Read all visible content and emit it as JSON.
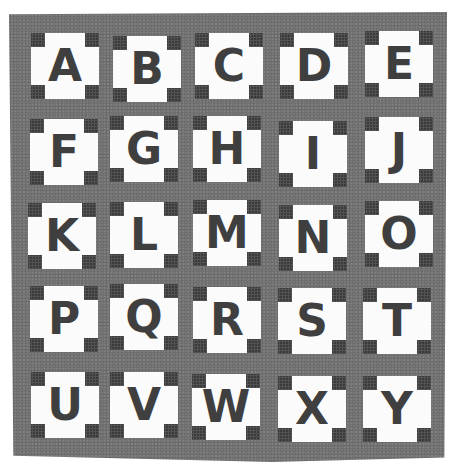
{
  "image": {
    "description": "Black and white photograph of an alphabet quilt: 25 white blocks with dark square corners and dark appliqued letters on a gray background",
    "background_color": "#ffffff",
    "quilt_color": "#777777",
    "block_color": "#fbfbfb",
    "letter_color": "#3f3f3f",
    "corner_color": "#3a3a3a"
  },
  "quilt": {
    "rows": [
      {
        "letters": [
          "A",
          "B",
          "C",
          "D",
          "E"
        ]
      },
      {
        "letters": [
          "F",
          "G",
          "H",
          "I",
          "J"
        ]
      },
      {
        "letters": [
          "K",
          "L",
          "M",
          "N",
          "O"
        ]
      },
      {
        "letters": [
          "P",
          "Q",
          "R",
          "S",
          "T"
        ]
      },
      {
        "letters": [
          "U",
          "V",
          "W",
          "X",
          "Y"
        ]
      }
    ]
  }
}
